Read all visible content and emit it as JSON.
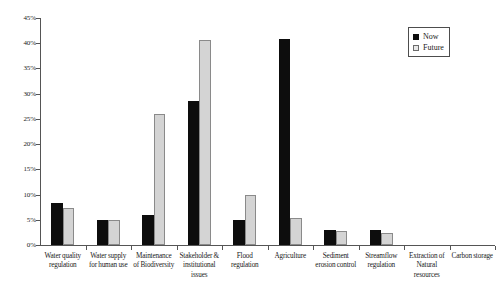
{
  "chart_data": {
    "type": "bar",
    "title": "",
    "subtitle": "",
    "xlabel": "",
    "ylabel": "",
    "ylim": [
      0,
      45
    ],
    "ytick_labels": [
      "0%",
      "5%",
      "10%",
      "15%",
      "20%",
      "25%",
      "30%",
      "35%",
      "40%",
      "45%"
    ],
    "ytick_values": [
      0,
      5,
      10,
      15,
      20,
      25,
      30,
      35,
      40,
      45
    ],
    "grid": false,
    "legend_position": "top-right",
    "categories": [
      "Water quality regulation",
      "Water supply for human use",
      "Maintenance of Biodiversity",
      "Stakeholder & institutional issues",
      "Flood regulation",
      "Agriculture",
      "Sediment erosion control",
      "Streamflow regulation",
      "Extraction of Natural resources",
      "Carbon storage"
    ],
    "category_label_lines": [
      [
        "Water quality",
        "regulation"
      ],
      [
        "Water supply",
        "for human use"
      ],
      [
        "Maintenance",
        "of Biodiversity"
      ],
      [
        "Stakeholder &",
        "institutional",
        "issues"
      ],
      [
        "Flood",
        "regulation"
      ],
      [
        "Agriculture"
      ],
      [
        "Sediment",
        "erosion control"
      ],
      [
        "Streamflow",
        "regulation"
      ],
      [
        "Extraction of",
        "Natural",
        "resources"
      ],
      [
        "Carbon storage"
      ]
    ],
    "series": [
      {
        "name": "Now",
        "color": "#0d0d0d",
        "values": [
          8.3,
          5.0,
          6.0,
          28.6,
          4.9,
          40.8,
          3.0,
          3.0,
          0,
          0
        ]
      },
      {
        "name": "Future",
        "color": "#d4d4d4",
        "values": [
          7.4,
          5.0,
          26.0,
          40.7,
          10.0,
          5.4,
          2.8,
          2.3,
          0,
          0
        ]
      }
    ]
  },
  "legend": {
    "entries": [
      {
        "label": "Now",
        "swatch": "now"
      },
      {
        "label": "Future",
        "swatch": "future"
      }
    ]
  }
}
